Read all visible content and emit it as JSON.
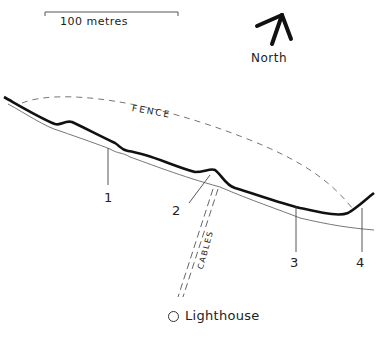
{
  "scale_bar": {
    "label": "100 metres"
  },
  "compass": {
    "label": "North",
    "icon": "north-arrow-icon"
  },
  "features": {
    "fence_label": "FENCE",
    "cables_label": "CABLES",
    "lighthouse_label": "Lighthouse",
    "lighthouse_icon": "circle-icon"
  },
  "points": [
    {
      "id": "1",
      "label": "1"
    },
    {
      "id": "2",
      "label": "2"
    },
    {
      "id": "3",
      "label": "3"
    },
    {
      "id": "4",
      "label": "4"
    }
  ],
  "colors": {
    "ink": "#222222",
    "line_thin": "#555555",
    "fence": "#777777"
  }
}
